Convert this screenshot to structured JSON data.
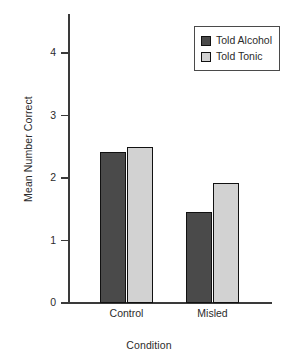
{
  "chart_data": {
    "type": "bar",
    "title": "",
    "xlabel": "Condition",
    "ylabel": "Mean Number Correct",
    "categories": [
      "Control",
      "Misled"
    ],
    "series": [
      {
        "name": "Told Alcohol",
        "values": [
          2.42,
          1.45
        ],
        "color": "#4a4a4a"
      },
      {
        "name": "Told Tonic",
        "values": [
          2.5,
          1.92
        ],
        "color": "#d2d2d2"
      }
    ],
    "yticks": [
      0,
      1,
      2,
      3,
      4
    ],
    "ytick_labels": [
      "0",
      "1",
      "2",
      "3",
      "4"
    ],
    "ylim": [
      0,
      4.6
    ],
    "grid": false,
    "legend_position": "top-right"
  },
  "legend": {
    "entries": [
      {
        "label": "Told Alcohol"
      },
      {
        "label": "Told Tonic"
      }
    ]
  },
  "axes": {
    "y_title": "Mean Number Correct",
    "x_title": "Condition"
  }
}
